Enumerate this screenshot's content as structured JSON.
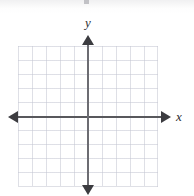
{
  "figure": {
    "kind": "blank-cartesian-coordinate-plane",
    "width": 194,
    "height": 196,
    "background_color": "#ffffff"
  },
  "grid": {
    "visible": true,
    "cell_size_px": 14,
    "columns": 10,
    "rows": 10,
    "left_px": 18,
    "top_px": 46,
    "width_px": 140,
    "height_px": 140,
    "line_color": "#c4c6d2"
  },
  "axes": {
    "origin": {
      "x_px": 88,
      "y_px": 117
    },
    "axis_color": "#3c3c40",
    "x_axis": {
      "label": "x",
      "label_style": "italic-serif",
      "start_px": 8,
      "end_px": 171,
      "arrowheads": "both"
    },
    "y_axis": {
      "label": "y",
      "label_style": "italic-serif",
      "start_px": 35,
      "end_px": 195,
      "arrowheads": "both"
    },
    "tick_labels": [],
    "numbers_shown": false
  },
  "plot": {
    "series": [],
    "points": [],
    "annotations": []
  },
  "artifacts": {
    "top_scan_smudge": true
  },
  "chart_data": {
    "type": "scatter",
    "title": "",
    "xlabel": "x",
    "ylabel": "y",
    "x": [],
    "y": [],
    "series": [],
    "xlim": [
      -5,
      5
    ],
    "ylim": [
      -5,
      5
    ],
    "grid": true,
    "legend": "none",
    "tick_labels_shown": false,
    "note": "Empty coordinate grid; no data plotted."
  }
}
